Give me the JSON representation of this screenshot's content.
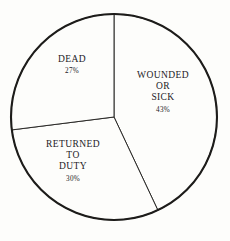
{
  "chart_data": {
    "type": "pie",
    "title": "",
    "subtitle": "",
    "xlabel": "",
    "ylabel": "",
    "legend_position": "inside-slices",
    "grid": false,
    "units": "percent",
    "categories": [
      "WOUNDED OR SICK",
      "RETURNED TO DUTY",
      "DEAD"
    ],
    "values": [
      43,
      30,
      27
    ],
    "slices": [
      {
        "name": "wounded-or-sick",
        "label_lines": [
          "WOUNDED",
          "OR",
          "SICK"
        ],
        "value": 43,
        "value_label": "43%",
        "start_angle_deg": 0,
        "end_angle_deg": 154.8,
        "color": "#fdfdfb",
        "stroke": "#1d1c1a"
      },
      {
        "name": "returned-to-duty",
        "label_lines": [
          "RETURNED",
          "TO",
          "DUTY"
        ],
        "value": 30,
        "value_label": "30%",
        "start_angle_deg": 154.8,
        "end_angle_deg": 262.8,
        "color": "#fdfdfb",
        "stroke": "#1d1c1a"
      },
      {
        "name": "dead",
        "label_lines": [
          "DEAD"
        ],
        "value": 27,
        "value_label": "27%",
        "start_angle_deg": 262.8,
        "end_angle_deg": 360,
        "color": "#fdfdfb",
        "stroke": "#1d1c1a"
      }
    ],
    "geometry": {
      "center_x": 114,
      "center_y": 117,
      "radius": 103
    },
    "style": {
      "background": "#fdfdfb",
      "outline_color": "#1d1c1a",
      "divider_color": "#2b2a28",
      "text_color": "#23211f"
    }
  },
  "labels": {
    "dead": {
      "line1": "DEAD",
      "percent": "27%"
    },
    "wounded": {
      "line1": "WOUNDED",
      "line2": "OR",
      "line3": "SICK",
      "percent": "43%"
    },
    "returned": {
      "line1": "RETURNED",
      "line2": "TO",
      "line3": "DUTY",
      "percent": "30%"
    }
  }
}
